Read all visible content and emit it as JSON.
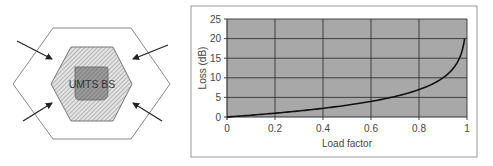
{
  "diagram": {
    "center_label": "UMTS BS",
    "arrows": 4,
    "colors": {
      "outline": "#888888",
      "inner_hatch": "#9a9a9a",
      "inner_square": "#8c8c8c",
      "arrow": "#222222"
    }
  },
  "chart_data": {
    "type": "line",
    "title": "",
    "xlabel": "Load factor",
    "ylabel": "Loss (dB)",
    "xlim": [
      0,
      1
    ],
    "ylim": [
      0,
      25
    ],
    "x_ticks": [
      "0",
      "0.2",
      "0.4",
      "0.6",
      "0.8",
      "1"
    ],
    "y_ticks": [
      "0",
      "5",
      "10",
      "15",
      "20",
      "25"
    ],
    "grid": true,
    "legend": null,
    "series": [
      {
        "name": "Loss",
        "x": [
          0,
          0.1,
          0.2,
          0.3,
          0.4,
          0.5,
          0.6,
          0.7,
          0.8,
          0.85,
          0.9,
          0.93,
          0.95,
          0.97,
          0.98,
          0.99
        ],
        "y": [
          0,
          0.46,
          0.97,
          1.55,
          2.22,
          3.01,
          3.98,
          5.23,
          6.99,
          8.24,
          10.0,
          11.55,
          13.01,
          15.23,
          16.99,
          20.0
        ]
      }
    ],
    "colors": {
      "plot_bg": "#a8a8a8",
      "grid": "#333333",
      "line": "#111111",
      "frame": "#999999"
    }
  }
}
